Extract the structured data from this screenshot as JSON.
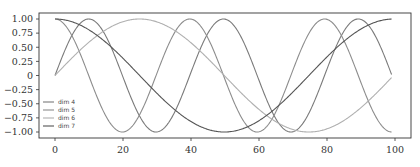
{
  "chart_data": {
    "type": "line",
    "title": "",
    "xlabel": "",
    "ylabel": "",
    "xlim": [
      -5,
      104
    ],
    "ylim": [
      -1.08,
      1.08
    ],
    "x_ticks": [
      0,
      20,
      40,
      60,
      80,
      100
    ],
    "x_tick_labels": [
      "0",
      "20",
      "40",
      "60",
      "80",
      "100"
    ],
    "y_ticks": [
      1.0,
      0.75,
      0.5,
      0.25,
      0,
      -0.25,
      -0.5,
      -0.75,
      -1.0
    ],
    "y_tick_labels": [
      "1.00",
      "0.75",
      "0.50",
      "0.25",
      "0",
      "−0.25",
      "−0.50",
      "−0.75",
      "−1.00"
    ],
    "grid": false,
    "legend_position": "lower left",
    "x_range": [
      0,
      99
    ],
    "series": [
      {
        "name": "dim 4",
        "func": "sin",
        "omega": 0.1585,
        "color": "#7a7a7a"
      },
      {
        "name": "dim 5",
        "func": "cos",
        "omega": 0.1585,
        "color": "#8c8c8c"
      },
      {
        "name": "dim 6",
        "func": "sin",
        "omega": 0.0631,
        "color": "#b0b0b0"
      },
      {
        "name": "dim 7",
        "func": "cos",
        "omega": 0.0631,
        "color": "#555555"
      }
    ],
    "sample_points": {
      "x": [
        0,
        10,
        20,
        30,
        40,
        50,
        60,
        70,
        80,
        90,
        99
      ],
      "dim 4": [
        0,
        1.0,
        0.0,
        -1.0,
        0.0,
        1.0,
        0.0,
        -1.0,
        0.0,
        1.0,
        -0.14
      ],
      "dim 5": [
        1.0,
        0.0,
        -1.0,
        0.0,
        1.0,
        0.0,
        -1.0,
        0.0,
        1.0,
        0.0,
        -0.99
      ],
      "dim 6": [
        0,
        0.59,
        0.95,
        0.95,
        0.58,
        0.01,
        -0.57,
        -0.95,
        -0.95,
        -0.6,
        -0.03
      ],
      "dim 7": [
        1.0,
        0.81,
        0.31,
        -0.31,
        -0.81,
        -1.0,
        -0.82,
        -0.32,
        0.3,
        0.8,
        1.0
      ]
    }
  }
}
